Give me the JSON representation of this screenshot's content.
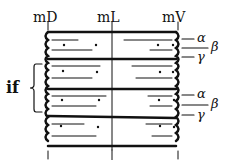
{
  "diagram": {
    "top_labels": [
      "mD",
      "mL",
      "mV"
    ],
    "right_labels_upper": [
      "α",
      "β",
      "γ"
    ],
    "right_labels_lower": [
      "α",
      "β",
      "γ"
    ],
    "left_bracket_label": "if",
    "colors": {
      "ink": "#111111",
      "background": "#ffffff"
    }
  }
}
